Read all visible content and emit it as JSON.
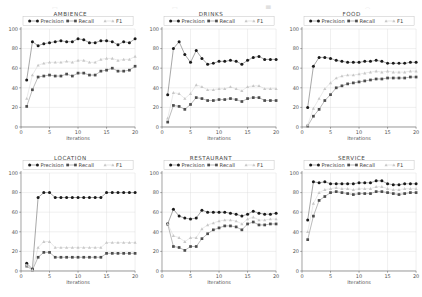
{
  "top_clipped_text": [
    "□",
    "□",
    "█",
    "○"
  ],
  "axis": {
    "xlabel": "Iterations",
    "ylabel": "",
    "xticks": [
      0,
      5,
      10,
      15,
      20
    ],
    "yticks": [
      0,
      20,
      40,
      60,
      80,
      100
    ],
    "xlim": [
      0,
      20
    ],
    "ylim": [
      0,
      100
    ]
  },
  "legend": {
    "position": "upper-center-inside",
    "entries": [
      "Precision",
      "Recall",
      "F1"
    ]
  },
  "colors": {
    "precision": "#1a1a1a",
    "recall": "#4d4d4d",
    "f1": "#c8c8c8",
    "grid": "#d8d8d8",
    "axis": "#555555",
    "background": "#ffffff"
  },
  "chart_data": [
    {
      "type": "line",
      "title": "AMBIENCE",
      "xlabel": "Iterations",
      "ylabel": "",
      "xlim": [
        0,
        20
      ],
      "ylim": [
        0,
        100
      ],
      "grid": true,
      "x": [
        1,
        2,
        3,
        4,
        5,
        6,
        7,
        8,
        9,
        10,
        11,
        12,
        13,
        14,
        15,
        16,
        17,
        18,
        19,
        20
      ],
      "series": [
        {
          "name": "Precision",
          "values": [
            48,
            87,
            83,
            85,
            86,
            87,
            88,
            87,
            87,
            90,
            89,
            86,
            86,
            88,
            88,
            87,
            84,
            87,
            86,
            90
          ]
        },
        {
          "name": "Recall",
          "values": [
            21,
            38,
            51,
            52,
            53,
            52,
            52,
            54,
            52,
            55,
            55,
            53,
            53,
            57,
            58,
            60,
            57,
            57,
            58,
            62
          ]
        },
        {
          "name": "F1",
          "values": [
            29,
            53,
            63,
            65,
            66,
            66,
            66,
            67,
            66,
            68,
            68,
            66,
            66,
            69,
            70,
            70,
            68,
            69,
            69,
            72
          ]
        }
      ]
    },
    {
      "type": "line",
      "title": "DRINKS",
      "xlabel": "Iterations",
      "ylabel": "",
      "xlim": [
        0,
        20
      ],
      "ylim": [
        0,
        100
      ],
      "grid": true,
      "x": [
        1,
        2,
        3,
        4,
        5,
        6,
        7,
        8,
        9,
        10,
        11,
        12,
        13,
        14,
        15,
        16,
        17,
        18,
        19,
        20
      ],
      "series": [
        {
          "name": "Precision",
          "values": [
            33,
            80,
            87,
            74,
            66,
            78,
            70,
            64,
            65,
            67,
            67,
            68,
            67,
            64,
            68,
            71,
            72,
            69,
            69,
            69
          ]
        },
        {
          "name": "Recall",
          "values": [
            5,
            22,
            21,
            18,
            23,
            30,
            29,
            27,
            27,
            28,
            28,
            29,
            28,
            26,
            29,
            30,
            30,
            27,
            27,
            27
          ]
        },
        {
          "name": "F1",
          "values": [
            9,
            35,
            34,
            29,
            34,
            43,
            41,
            38,
            38,
            39,
            39,
            41,
            39,
            37,
            41,
            42,
            42,
            39,
            39,
            39
          ]
        }
      ]
    },
    {
      "type": "line",
      "title": "FOOD",
      "xlabel": "Iterations",
      "ylabel": "",
      "xlim": [
        0,
        20
      ],
      "ylim": [
        0,
        100
      ],
      "grid": true,
      "x": [
        1,
        2,
        3,
        4,
        5,
        6,
        7,
        8,
        9,
        10,
        11,
        12,
        13,
        14,
        15,
        16,
        17,
        18,
        19,
        20
      ],
      "series": [
        {
          "name": "Precision",
          "values": [
            20,
            62,
            71,
            71,
            70,
            68,
            67,
            66,
            66,
            66,
            67,
            67,
            68,
            67,
            65,
            65,
            65,
            65,
            66,
            66
          ]
        },
        {
          "name": "Recall",
          "values": [
            1,
            11,
            18,
            27,
            33,
            40,
            42,
            44,
            45,
            46,
            47,
            48,
            49,
            49,
            50,
            50,
            50,
            50,
            51,
            51
          ]
        },
        {
          "name": "F1",
          "values": [
            2,
            19,
            29,
            39,
            45,
            50,
            52,
            53,
            53,
            54,
            55,
            56,
            57,
            56,
            57,
            56,
            56,
            56,
            57,
            57
          ]
        }
      ]
    },
    {
      "type": "line",
      "title": "LOCATION",
      "xlabel": "Iterations",
      "ylabel": "",
      "xlim": [
        0,
        20
      ],
      "ylim": [
        0,
        100
      ],
      "grid": true,
      "x": [
        1,
        2,
        3,
        4,
        5,
        6,
        7,
        8,
        9,
        10,
        11,
        12,
        13,
        14,
        15,
        16,
        17,
        18,
        19,
        20
      ],
      "series": [
        {
          "name": "Precision",
          "values": [
            8,
            2,
            75,
            80,
            80,
            75,
            75,
            75,
            75,
            75,
            75,
            75,
            75,
            75,
            80,
            80,
            80,
            80,
            80,
            80
          ]
        },
        {
          "name": "Recall",
          "values": [
            5,
            1,
            14,
            19,
            19,
            14,
            14,
            14,
            14,
            14,
            14,
            14,
            14,
            14,
            18,
            18,
            18,
            18,
            18,
            18
          ]
        },
        {
          "name": "F1",
          "values": [
            6,
            1,
            24,
            30,
            30,
            24,
            24,
            24,
            24,
            24,
            24,
            24,
            24,
            24,
            29,
            29,
            29,
            29,
            29,
            29
          ]
        }
      ]
    },
    {
      "type": "line",
      "title": "RESTAURANT",
      "xlabel": "Iterations",
      "ylabel": "",
      "xlim": [
        0,
        20
      ],
      "ylim": [
        0,
        100
      ],
      "grid": true,
      "x": [
        1,
        2,
        3,
        4,
        5,
        6,
        7,
        8,
        9,
        10,
        11,
        12,
        13,
        14,
        15,
        16,
        17,
        18,
        19,
        20
      ],
      "series": [
        {
          "name": "Precision",
          "values": [
            48,
            63,
            56,
            54,
            53,
            54,
            62,
            60,
            60,
            60,
            60,
            59,
            58,
            56,
            58,
            61,
            59,
            58,
            58,
            59
          ]
        },
        {
          "name": "Recall",
          "values": [
            48,
            25,
            24,
            21,
            25,
            25,
            33,
            38,
            42,
            44,
            46,
            46,
            45,
            42,
            48,
            50,
            47,
            47,
            48,
            48
          ]
        },
        {
          "name": "F1",
          "values": [
            48,
            36,
            34,
            30,
            34,
            34,
            43,
            47,
            49,
            51,
            52,
            52,
            51,
            48,
            53,
            55,
            52,
            52,
            53,
            53
          ]
        }
      ]
    },
    {
      "type": "line",
      "title": "SERVICE",
      "xlabel": "Iterations",
      "ylabel": "",
      "xlim": [
        0,
        20
      ],
      "ylim": [
        0,
        100
      ],
      "grid": true,
      "x": [
        1,
        2,
        3,
        4,
        5,
        6,
        7,
        8,
        9,
        10,
        11,
        12,
        13,
        14,
        15,
        16,
        17,
        18,
        19,
        20
      ],
      "series": [
        {
          "name": "Precision",
          "values": [
            52,
            91,
            90,
            91,
            89,
            89,
            89,
            89,
            89,
            90,
            90,
            90,
            92,
            92,
            89,
            88,
            88,
            89,
            89,
            89
          ]
        },
        {
          "name": "Recall",
          "values": [
            32,
            56,
            72,
            76,
            80,
            81,
            80,
            79,
            78,
            79,
            79,
            79,
            81,
            81,
            80,
            79,
            78,
            79,
            80,
            80
          ]
        },
        {
          "name": "F1",
          "values": [
            40,
            69,
            80,
            83,
            84,
            85,
            84,
            84,
            83,
            84,
            84,
            84,
            86,
            86,
            84,
            83,
            83,
            84,
            84,
            84
          ]
        }
      ]
    }
  ]
}
